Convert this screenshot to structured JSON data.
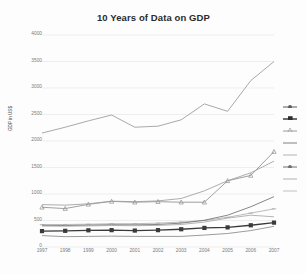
{
  "chart_data": {
    "type": "line",
    "title": "10 Years of Data on GDP",
    "xlabel": "",
    "ylabel": "GDP in US$",
    "categories": [
      "1997",
      "1998",
      "1999",
      "2000",
      "2001",
      "2002",
      "2003",
      "2004",
      "2005",
      "2006",
      "2007"
    ],
    "ylim": [
      0,
      4000
    ],
    "ytick_values": [
      0,
      500,
      1000,
      1500,
      2000,
      2500,
      3000,
      3500,
      4000
    ],
    "ytick_labels": [
      "0",
      "500",
      "1000",
      "1500",
      "2000",
      "2500",
      "3000",
      "3500",
      "4000"
    ],
    "grid": true,
    "legend_position": "right",
    "series": [
      {
        "name": "series-1",
        "color": "#9a9a9a",
        "marker": "none",
        "values": [
          2150,
          2260,
          2380,
          2490,
          2260,
          2280,
          2400,
          2700,
          2560,
          3140,
          3500
        ]
      },
      {
        "name": "series-2",
        "color": "#8f8f8f",
        "marker": "triangle",
        "values": [
          750,
          725,
          805,
          860,
          845,
          855,
          845,
          845,
          1250,
          1350,
          1800
        ]
      },
      {
        "name": "series-3",
        "color": "#9e9e9e",
        "marker": "none",
        "values": [
          800,
          790,
          815,
          865,
          855,
          870,
          915,
          1060,
          1250,
          1400,
          1620
        ]
      },
      {
        "name": "series-4",
        "color": "#b0b0b0",
        "marker": "dash",
        "values": [
          420,
          425,
          430,
          440,
          440,
          450,
          470,
          500,
          560,
          640,
          720
        ]
      },
      {
        "name": "series-5",
        "color": "#707070",
        "marker": "none",
        "values": [
          410,
          405,
          412,
          420,
          418,
          425,
          450,
          505,
          600,
          760,
          950
        ]
      },
      {
        "name": "series-6",
        "color": "#3a3a3a",
        "marker": "square",
        "values": [
          300,
          305,
          315,
          318,
          310,
          318,
          335,
          360,
          370,
          410,
          460
        ]
      },
      {
        "name": "series-7",
        "color": "#8a8a8a",
        "marker": "none",
        "values": [
          215,
          195,
          200,
          205,
          200,
          200,
          200,
          225,
          255,
          310,
          390
        ]
      },
      {
        "name": "series-8",
        "color": "#a8a8a8",
        "marker": "none",
        "values": [
          395,
          392,
          398,
          405,
          402,
          408,
          425,
          470,
          545,
          600,
          570
        ]
      }
    ]
  },
  "legend": {
    "entries": [
      {
        "name": "legend-entry-1",
        "label": "",
        "color": "#5a5a5a",
        "marker": "dot"
      },
      {
        "name": "legend-entry-2",
        "label": "",
        "color": "#2e2e2e",
        "marker": "square"
      },
      {
        "name": "legend-entry-3",
        "label": "",
        "color": "#9a9a9a",
        "marker": "triangle"
      },
      {
        "name": "legend-entry-4",
        "label": "",
        "color": "#808080",
        "marker": "line"
      },
      {
        "name": "legend-entry-5",
        "label": "",
        "color": "#b4b4b4",
        "marker": "line"
      },
      {
        "name": "legend-entry-6",
        "label": "",
        "color": "#6e6e6e",
        "marker": "dot"
      },
      {
        "name": "legend-entry-7",
        "label": "",
        "color": "#b0b0b0",
        "marker": "line"
      },
      {
        "name": "legend-entry-8",
        "label": "",
        "color": "#c0c0c0",
        "marker": "line"
      }
    ]
  },
  "colors": {
    "background": "#fdfdfd",
    "grid": "#e6e6e6",
    "axis_text": "#7a7a7a",
    "title_text": "#2b2b2b"
  }
}
